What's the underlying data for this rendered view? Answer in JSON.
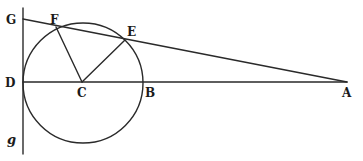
{
  "figure": {
    "colors": {
      "ink": "#2a2a2a",
      "background": "#ffffff"
    },
    "points": {
      "G": {
        "label": "G",
        "x": 23,
        "y": 19
      },
      "F": {
        "label": "F",
        "x": 56,
        "y": 27
      },
      "E": {
        "label": "E",
        "x": 125,
        "y": 40
      },
      "D": {
        "label": "D",
        "x": 23,
        "y": 82
      },
      "C": {
        "label": "C",
        "x": 82,
        "y": 82
      },
      "B": {
        "label": "B",
        "x": 143,
        "y": 82
      },
      "A": {
        "label": "A",
        "x": 347,
        "y": 82
      },
      "g": {
        "label": "g",
        "x": 23,
        "y": 150
      }
    },
    "circle": {
      "center": "C",
      "cx": 83,
      "cy": 83,
      "r": 60
    },
    "segments": [
      {
        "from": "G",
        "to": "g",
        "name": "tangent-line-Gg"
      },
      {
        "from": "G",
        "to": "A",
        "name": "secant-line-GA"
      },
      {
        "from": "D",
        "to": "A",
        "name": "diameter-line-DA"
      },
      {
        "from": "C",
        "to": "F",
        "name": "radius-CF"
      },
      {
        "from": "C",
        "to": "E",
        "name": "radius-CE"
      }
    ],
    "labels": {
      "G": "G",
      "F": "F",
      "E": "E",
      "D": "D",
      "C": "C",
      "B": "B",
      "A": "A",
      "g": "g"
    }
  }
}
